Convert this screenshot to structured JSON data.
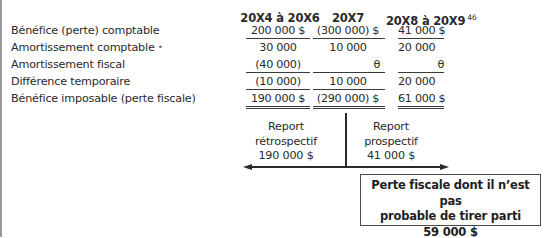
{
  "table": {
    "columns": [
      {
        "label": "20X4 à 20X6",
        "footnote": ""
      },
      {
        "label": "20X7",
        "footnote": ""
      },
      {
        "label": "20X8 à 20X9",
        "footnote": "46"
      }
    ],
    "rows": [
      {
        "label": "Bénéfice (perte) comptable",
        "values": [
          "200 000 $",
          "(300 000) $",
          "41 000 $"
        ]
      },
      {
        "label": "Amortissement comptable",
        "marker": "•",
        "values": [
          "30 000",
          "10 000",
          "20 000"
        ]
      },
      {
        "label": "Amortissement fiscal",
        "values": [
          "(40 000)",
          "θ",
          "θ"
        ]
      },
      {
        "label": "Différence temporaire",
        "values": [
          "(10 000)",
          "10 000",
          "20 000"
        ]
      },
      {
        "label": "Bénéfice imposable (perte fiscale)",
        "values": [
          "190 000 $",
          "(290 000) $",
          "61 000 $"
        ]
      }
    ]
  },
  "diagram": {
    "carryback": {
      "line1": "Report",
      "line2": "rétrospectif",
      "amount": "190 000 $"
    },
    "carryforward": {
      "line1": "Report",
      "line2": "prospectif",
      "amount": "41 000 $"
    },
    "unused_loss": {
      "line1": "Perte fiscale dont il n’est pas",
      "line2": "probable de tirer parti",
      "amount": "59 000 $"
    }
  }
}
